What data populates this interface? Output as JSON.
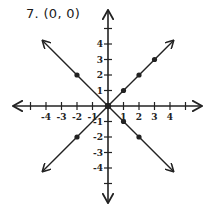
{
  "problem": {
    "number": "7.",
    "answer": "(0, 0)",
    "title": "7. (0, 0)"
  },
  "chart_data": {
    "type": "line",
    "title": "7. (0, 0)",
    "xlabel": "",
    "ylabel": "",
    "xlim": [
      -5,
      5
    ],
    "ylim": [
      -5,
      5
    ],
    "grid": false,
    "x_tick_labels": [
      "-4",
      "-3",
      "-2",
      "-1",
      "1",
      "2",
      "3",
      "4"
    ],
    "y_tick_labels": [
      "4",
      "3",
      "2",
      "1",
      "-1",
      "-2",
      "-3",
      "-4"
    ],
    "intersection": {
      "x": 0,
      "y": 0
    },
    "series": [
      {
        "name": "y = x",
        "points": [
          [
            -2,
            -2
          ],
          [
            1,
            1
          ],
          [
            2,
            2
          ],
          [
            3,
            3
          ]
        ],
        "extends_both_directions": true
      },
      {
        "name": "y = -x",
        "points": [
          [
            -2,
            2
          ],
          [
            1,
            -1
          ],
          [
            2,
            -2
          ]
        ],
        "extends_both_directions": true
      }
    ]
  },
  "colors": {
    "ink": "#222222",
    "background": "#ffffff"
  }
}
